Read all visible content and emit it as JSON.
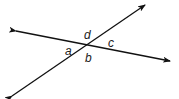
{
  "diagram": {
    "type": "intersecting-lines",
    "line_color": "#111111",
    "background": "#ffffff",
    "intersection": {
      "x": 88,
      "y": 45
    },
    "lines": [
      {
        "name": "line-1",
        "from": {
          "x": 16,
          "y": 31
        },
        "to": {
          "x": 170,
          "y": 61
        },
        "arrows": "both"
      },
      {
        "name": "line-2",
        "from": {
          "x": 12,
          "y": 96
        },
        "to": {
          "x": 145,
          "y": 5
        },
        "arrows": "both"
      }
    ],
    "angle_labels": [
      {
        "id": "a",
        "text": "a",
        "x": 65,
        "y": 45
      },
      {
        "id": "b",
        "text": "b",
        "x": 85,
        "y": 52
      },
      {
        "id": "c",
        "text": "c",
        "x": 108,
        "y": 37
      },
      {
        "id": "d",
        "text": "d",
        "x": 84,
        "y": 29
      }
    ]
  }
}
